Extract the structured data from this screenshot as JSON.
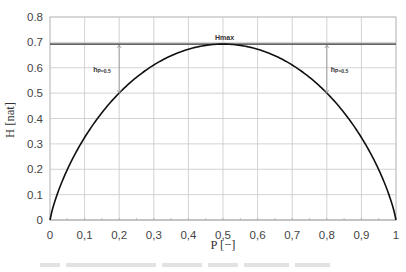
{
  "chart_data": {
    "type": "line",
    "title": "",
    "xlabel": "P [−]",
    "ylabel": "H [nat]",
    "xlim": [
      0,
      1
    ],
    "ylim": [
      0,
      0.8
    ],
    "grid": true,
    "x_ticks": [
      "0",
      "0,1",
      "0,2",
      "0,3",
      "0,4",
      "0,5",
      "0,6",
      "0,7",
      "0,8",
      "0,9",
      "1"
    ],
    "y_ticks": [
      "0",
      "0,1",
      "0,2",
      "0,3",
      "0,4",
      "0,5",
      "0,6",
      "0,7",
      "0,8"
    ],
    "series": [
      {
        "name": "H(P) = -P ln P - (1-P) ln(1-P)",
        "x": [
          0,
          0.05,
          0.1,
          0.15,
          0.2,
          0.25,
          0.3,
          0.35,
          0.4,
          0.45,
          0.5,
          0.55,
          0.6,
          0.65,
          0.7,
          0.75,
          0.8,
          0.85,
          0.9,
          0.95,
          1
        ],
        "values": [
          0,
          0.199,
          0.325,
          0.423,
          0.5,
          0.562,
          0.611,
          0.647,
          0.673,
          0.688,
          0.693,
          0.688,
          0.673,
          0.647,
          0.611,
          0.562,
          0.5,
          0.423,
          0.325,
          0.199,
          0
        ]
      }
    ],
    "hlines": [
      {
        "label": "Hmax",
        "y": 0.693
      }
    ],
    "annotations": [
      {
        "label": "h",
        "subscript": "P=0.5",
        "x": 0.2,
        "y_from": 0.5,
        "y_to": 0.693
      },
      {
        "label": "h",
        "subscript": "P=0.5",
        "x": 0.8,
        "y_from": 0.5,
        "y_to": 0.693
      }
    ]
  }
}
